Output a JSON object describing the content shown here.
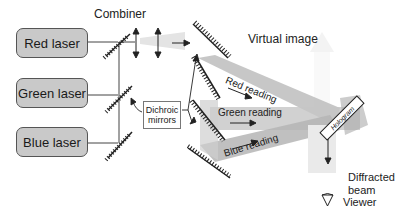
{
  "diagram": {
    "lasers": [
      {
        "label": "Red laser"
      },
      {
        "label": "Green laser"
      },
      {
        "label": "Blue laser"
      }
    ],
    "combiner_label": "Combiner",
    "dichroic_label_line1": "Dichroic",
    "dichroic_label_line2": "mirrors",
    "virtual_image_label": "Virtual image",
    "readings": [
      {
        "label": "Red reading"
      },
      {
        "label": "Green reading"
      },
      {
        "label": "Blue reading"
      }
    ],
    "hologram_label": "Hologram",
    "diffracted_line1": "Diffracted",
    "diffracted_line2": "beam",
    "viewer_label": "Viewer"
  }
}
